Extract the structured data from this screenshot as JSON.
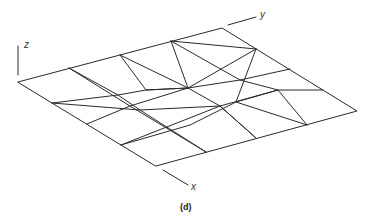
{
  "figure": {
    "caption": "(d)",
    "axes": {
      "x_label": "x",
      "y_label": "y",
      "z_label": "z"
    },
    "mesh": {
      "description": "4x4 grid surface in oblique projection with displaced interior grid lines",
      "rows": 4,
      "cols": 4,
      "corners": {
        "left": [
          18,
          82
        ],
        "top": [
          222,
          28
        ],
        "right": [
          357,
          111
        ],
        "bottom": [
          156,
          166
        ]
      }
    },
    "line_color": "#2a2a2a",
    "background": "#ffffff"
  }
}
